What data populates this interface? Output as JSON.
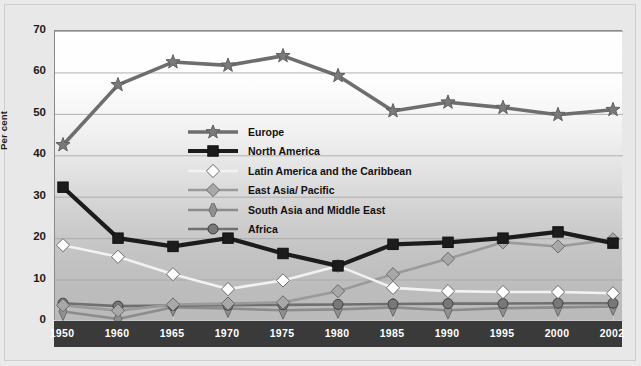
{
  "chart_data": {
    "type": "line",
    "title": "",
    "xlabel": "",
    "ylabel": "Per cent",
    "categories": [
      "1950",
      "1960",
      "1965",
      "1970",
      "1975",
      "1980",
      "1985",
      "1990",
      "1995",
      "2000",
      "2002"
    ],
    "ylim": [
      0,
      70
    ],
    "ytick_step": 10,
    "yticks": [
      "0",
      "10",
      "20",
      "30",
      "40",
      "50",
      "60",
      "70"
    ],
    "grid": true,
    "legend_position": "center-left-inside",
    "series": [
      {
        "name": "Europe",
        "marker": "star",
        "color": "#6e6e6e",
        "fill": "#7a7a7a",
        "values": [
          42.5,
          57.0,
          62.5,
          61.7,
          64.0,
          59.2,
          50.7,
          52.8,
          51.5,
          49.8,
          51.0
        ]
      },
      {
        "name": "North America",
        "marker": "square",
        "color": "#1c1c1c",
        "fill": "#1c1c1c",
        "values": [
          32.3,
          20.0,
          18.0,
          20.0,
          16.3,
          13.3,
          18.5,
          19.0,
          20.0,
          21.5,
          18.8
        ]
      },
      {
        "name": "Latin America and the Caribbean",
        "marker": "diamond",
        "color": "#f2f2f2",
        "fill": "#ffffff",
        "values": [
          18.3,
          15.5,
          11.3,
          7.7,
          9.8,
          13.3,
          8.0,
          7.2,
          7.0,
          7.0,
          6.7
        ]
      },
      {
        "name": "East Asia/ Pacific",
        "marker": "diamond",
        "color": "#9a9a9a",
        "fill": "#a8a8a8",
        "values": [
          3.8,
          2.5,
          4.0,
          4.2,
          4.5,
          7.2,
          11.3,
          15.0,
          19.0,
          18.0,
          19.7
        ]
      },
      {
        "name": "South Asia and Middle East",
        "marker": "diamond-tall",
        "color": "#8c8c8c",
        "fill": "#909090",
        "values": [
          2.3,
          0.5,
          3.3,
          3.0,
          2.6,
          2.8,
          3.3,
          2.6,
          3.1,
          3.3,
          3.5
        ]
      },
      {
        "name": "Africa",
        "marker": "circle",
        "color": "#707070",
        "fill": "#787878",
        "values": [
          4.3,
          3.6,
          3.7,
          3.8,
          3.9,
          4.0,
          4.1,
          4.2,
          4.2,
          4.3,
          4.3
        ]
      }
    ]
  },
  "axis": {
    "ylabel": "Per cent"
  }
}
